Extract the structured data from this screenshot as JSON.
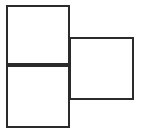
{
  "figure": {
    "canvas": {
      "width": 143,
      "height": 136
    },
    "style": {
      "background_color": "#ffffff",
      "stroke_color": "#2b2b2b",
      "stroke_width": 2,
      "fill_color": "none"
    },
    "shapes": [
      {
        "name": "top-left-square",
        "label": "",
        "x": 6,
        "y": 5,
        "width": 64,
        "height": 60
      },
      {
        "name": "bottom-left-square",
        "label": "",
        "x": 6,
        "y": 65,
        "width": 64,
        "height": 63
      },
      {
        "name": "right-square",
        "label": "",
        "x": 69,
        "y": 37,
        "width": 65,
        "height": 63
      }
    ]
  }
}
